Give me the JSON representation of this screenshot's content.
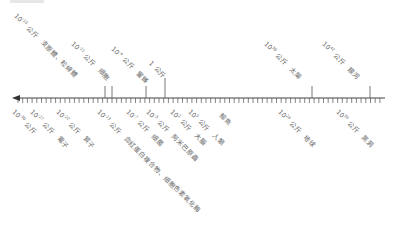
{
  "chart_data": {
    "type": "timeline",
    "title": "",
    "axis": {
      "direction": "decreasing-left",
      "arrow": "left",
      "unit": "公斤"
    },
    "upper_marks": [
      {
        "exp": "-16",
        "unit": "公斤",
        "object": "支原體、粒線體",
        "x": 105
      },
      {
        "exp": "-11",
        "unit": "公斤",
        "object": "細胞",
        "x": 112
      },
      {
        "exp": "-4",
        "unit": "公斤",
        "object": "蜜蜂",
        "x": 146
      },
      {
        "exp": "",
        "base": "1",
        "unit": "公斤",
        "object": "",
        "x": 165
      },
      {
        "exp": "30",
        "unit": "公斤",
        "object": "太陽",
        "x": 312
      },
      {
        "exp": "42",
        "unit": "公斤",
        "object": "銀河",
        "x": 370
      }
    ],
    "lower_marks": [
      {
        "exp": "-30",
        "unit": "公斤",
        "object": "",
        "x": 18
      },
      {
        "exp": "-27",
        "unit": "公斤",
        "object": "電子",
        "x": 36
      },
      {
        "exp": "-22",
        "unit": "公斤",
        "object": "質子",
        "x": 62
      },
      {
        "exp": "-13",
        "unit": "公斤",
        "object": "血紅蛋白複合物、細胞色素氧化酶",
        "x": 103
      },
      {
        "exp": "-7",
        "unit": "公斤",
        "object": "細菌",
        "x": 132
      },
      {
        "exp": "-3",
        "unit": "公斤",
        "object": "阿米巴原蟲",
        "x": 152
      },
      {
        "exp": "2",
        "unit": "公斤",
        "object": "大腦",
        "x": 176
      },
      {
        "exp": "5",
        "unit": "公斤",
        "object": "人類",
        "x": 194
      },
      {
        "exp": "",
        "base": "",
        "unit": "",
        "object": "鯨魚",
        "x": 220
      },
      {
        "exp": "24",
        "unit": "公斤",
        "object": "地球",
        "x": 284
      },
      {
        "exp": "36",
        "unit": "公斤",
        "object": "黑洞",
        "x": 342
      }
    ]
  }
}
